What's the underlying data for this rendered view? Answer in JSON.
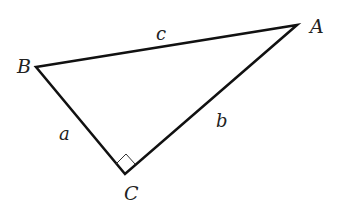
{
  "diagram": {
    "type": "right-triangle",
    "vertices": [
      {
        "name": "A",
        "x": 297,
        "y": 25,
        "label_x": 310,
        "label_y": 33
      },
      {
        "name": "B",
        "x": 36,
        "y": 67,
        "label_x": 17,
        "label_y": 73
      },
      {
        "name": "C",
        "x": 125,
        "y": 174,
        "label_x": 124,
        "label_y": 200
      }
    ],
    "sides": [
      {
        "name": "c",
        "from": "B",
        "to": "A",
        "label_x": 156,
        "label_y": 40
      },
      {
        "name": "a",
        "from": "B",
        "to": "C",
        "label_x": 59,
        "label_y": 140
      },
      {
        "name": "b",
        "from": "C",
        "to": "A",
        "label_x": 216,
        "label_y": 127
      }
    ],
    "right_angle_at": "C",
    "colors": {
      "stroke": "#111111",
      "marker": "#333333",
      "text": "#222222",
      "background": "#ffffff"
    }
  },
  "labels": {
    "A": "A",
    "B": "B",
    "C": "C",
    "a": "a",
    "b": "b",
    "c": "c"
  }
}
